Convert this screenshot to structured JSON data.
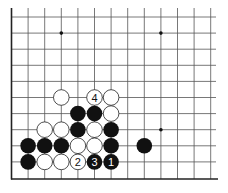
{
  "diagram": {
    "type": "go-board-fragment",
    "grid": {
      "origin_x": 11.5,
      "origin_y": 17,
      "spacing_x": 16.6,
      "spacing_y": 16.1,
      "columns": 13,
      "rows": 11,
      "visible_edges": [
        "left",
        "bottom"
      ]
    },
    "colors": {
      "line": "#555555",
      "edge": "#222222",
      "black_stone": "#111111",
      "white_stone": "#ffffff",
      "white_outline": "#222222"
    },
    "star_points": [
      {
        "col": 3,
        "row": 1
      },
      {
        "col": 9,
        "row": 1
      },
      {
        "col": 9,
        "row": 7
      }
    ],
    "stones": [
      {
        "col": 3,
        "row": 5,
        "color": "white",
        "label": ""
      },
      {
        "col": 5,
        "row": 5,
        "color": "white",
        "label": "4"
      },
      {
        "col": 6,
        "row": 5,
        "color": "white",
        "label": ""
      },
      {
        "col": 4,
        "row": 6,
        "color": "black",
        "label": ""
      },
      {
        "col": 5,
        "row": 6,
        "color": "black",
        "label": ""
      },
      {
        "col": 6,
        "row": 6,
        "color": "white",
        "label": ""
      },
      {
        "col": 2,
        "row": 7,
        "color": "white",
        "label": ""
      },
      {
        "col": 3,
        "row": 7,
        "color": "white",
        "label": ""
      },
      {
        "col": 4,
        "row": 7,
        "color": "black",
        "label": ""
      },
      {
        "col": 5,
        "row": 7,
        "color": "white",
        "label": ""
      },
      {
        "col": 6,
        "row": 7,
        "color": "black",
        "label": ""
      },
      {
        "col": 1,
        "row": 8,
        "color": "black",
        "label": ""
      },
      {
        "col": 2,
        "row": 8,
        "color": "black",
        "label": ""
      },
      {
        "col": 3,
        "row": 8,
        "color": "black",
        "label": ""
      },
      {
        "col": 4,
        "row": 8,
        "color": "white",
        "label": ""
      },
      {
        "col": 5,
        "row": 8,
        "color": "white",
        "label": ""
      },
      {
        "col": 6,
        "row": 8,
        "color": "black",
        "label": ""
      },
      {
        "col": 8,
        "row": 8,
        "color": "black",
        "label": ""
      },
      {
        "col": 1,
        "row": 9,
        "color": "black",
        "label": ""
      },
      {
        "col": 2,
        "row": 9,
        "color": "white",
        "label": ""
      },
      {
        "col": 3,
        "row": 9,
        "color": "white",
        "label": ""
      },
      {
        "col": 4,
        "row": 9,
        "color": "white",
        "label": "2"
      },
      {
        "col": 5,
        "row": 9,
        "color": "black",
        "label": "3"
      },
      {
        "col": 6,
        "row": 9,
        "color": "black",
        "label": "1"
      }
    ]
  }
}
